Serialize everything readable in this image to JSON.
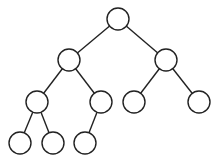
{
  "diagram": {
    "type": "binary-tree",
    "stroke_color": "#222222",
    "fill_color": "#ffffff",
    "node_radius": 11,
    "nodes": [
      {
        "id": "n0",
        "x": 118,
        "y": 19
      },
      {
        "id": "n1",
        "x": 69,
        "y": 60
      },
      {
        "id": "n2",
        "x": 166,
        "y": 60
      },
      {
        "id": "n3",
        "x": 37,
        "y": 102
      },
      {
        "id": "n4",
        "x": 101,
        "y": 102
      },
      {
        "id": "n5",
        "x": 134,
        "y": 102
      },
      {
        "id": "n6",
        "x": 199,
        "y": 102
      },
      {
        "id": "n7",
        "x": 20,
        "y": 143
      },
      {
        "id": "n8",
        "x": 53,
        "y": 143
      },
      {
        "id": "n9",
        "x": 85,
        "y": 143
      }
    ],
    "edges": [
      [
        "n0",
        "n1"
      ],
      [
        "n0",
        "n2"
      ],
      [
        "n1",
        "n3"
      ],
      [
        "n1",
        "n4"
      ],
      [
        "n2",
        "n5"
      ],
      [
        "n2",
        "n6"
      ],
      [
        "n3",
        "n7"
      ],
      [
        "n3",
        "n8"
      ],
      [
        "n4",
        "n9"
      ]
    ]
  }
}
